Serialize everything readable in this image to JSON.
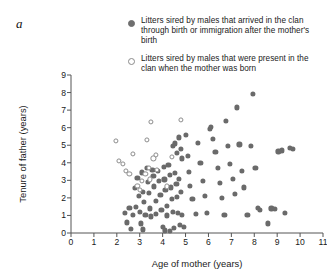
{
  "panel": {
    "label": "a"
  },
  "legend": {
    "position": "top-right",
    "items": [
      {
        "marker": "filled-circle",
        "color": "#6e6e6e",
        "label": "Litters sired by males that arrived in the clan through birth or immigration after the mother's birth"
      },
      {
        "marker": "open-circle",
        "color": "#8a8a8a",
        "label": "Litters sired by males that were present in the clan when the mother was born"
      }
    ]
  },
  "chart_data": {
    "type": "scatter",
    "title": "",
    "xlabel": "Age of mother (years)",
    "ylabel": "Tenure of father (years)",
    "xlim": [
      0,
      11
    ],
    "ylim": [
      0,
      9
    ],
    "xticks": [
      0,
      1,
      2,
      3,
      4,
      5,
      6,
      7,
      8,
      9,
      10,
      11
    ],
    "yticks": [
      0,
      1,
      2,
      3,
      4,
      5,
      6,
      7,
      8,
      9
    ],
    "xticklabels": [
      "0",
      "1",
      "2",
      "3",
      "4",
      "5",
      "6",
      "7",
      "8",
      "9",
      "10",
      "11"
    ],
    "yticklabels": [
      "0",
      "1",
      "2",
      "3",
      "4",
      "5",
      "6",
      "7",
      "8",
      "9"
    ],
    "grid": false,
    "series": [
      {
        "name": "Litters sired by males that arrived in the clan through birth or immigration after the mother's birth",
        "marker": "filled-circle",
        "color": "#6a6a6a",
        "points": [
          [
            2.35,
            1.15
          ],
          [
            2.45,
            0.6
          ],
          [
            2.55,
            1.45
          ],
          [
            2.7,
            1.05
          ],
          [
            2.8,
            2.55
          ],
          [
            2.85,
            1.5
          ],
          [
            2.9,
            3.15
          ],
          [
            2.95,
            2.1
          ],
          [
            3.0,
            1.2
          ],
          [
            3.05,
            0.55
          ],
          [
            3.1,
            3.45
          ],
          [
            3.15,
            2.35
          ],
          [
            3.2,
            1.75
          ],
          [
            3.25,
            1.05
          ],
          [
            3.3,
            3.7
          ],
          [
            3.35,
            2.9
          ],
          [
            3.4,
            2.3
          ],
          [
            3.45,
            1.4
          ],
          [
            3.5,
            0.95
          ],
          [
            3.55,
            3.6
          ],
          [
            3.6,
            3.25
          ],
          [
            3.62,
            2.65
          ],
          [
            3.7,
            1.85
          ],
          [
            3.72,
            1.1
          ],
          [
            3.8,
            3.55
          ],
          [
            3.85,
            2.95
          ],
          [
            3.9,
            2.15
          ],
          [
            3.95,
            1.3
          ],
          [
            4.0,
            0.35
          ],
          [
            4.05,
            3.75
          ],
          [
            4.08,
            3.05
          ],
          [
            4.12,
            2.45
          ],
          [
            4.18,
            1.55
          ],
          [
            4.2,
            1.0
          ],
          [
            4.25,
            3.9
          ],
          [
            4.3,
            3.3
          ],
          [
            4.35,
            2.6
          ],
          [
            4.4,
            1.95
          ],
          [
            4.45,
            1.2
          ],
          [
            4.5,
            0.3
          ],
          [
            4.55,
            3.4
          ],
          [
            4.6,
            2.8
          ],
          [
            4.62,
            2.05
          ],
          [
            4.68,
            1.15
          ],
          [
            4.72,
            3.1
          ],
          [
            4.8,
            2.35
          ],
          [
            4.85,
            1.05
          ],
          [
            4.92,
            0.35
          ],
          [
            4.45,
            4.95
          ],
          [
            4.55,
            5.1
          ],
          [
            4.62,
            4.55
          ],
          [
            4.7,
            5.45
          ],
          [
            4.78,
            4.8
          ],
          [
            4.85,
            4.25
          ],
          [
            5.0,
            5.6
          ],
          [
            5.1,
            4.4
          ],
          [
            5.15,
            3.5
          ],
          [
            5.2,
            2.7
          ],
          [
            5.3,
            1.95
          ],
          [
            5.45,
            1.1
          ],
          [
            5.55,
            5.15
          ],
          [
            5.65,
            4.0
          ],
          [
            5.75,
            2.95
          ],
          [
            5.85,
            2.1
          ],
          [
            5.95,
            1.15
          ],
          [
            6.05,
            5.95
          ],
          [
            6.1,
            6.05
          ],
          [
            6.2,
            5.35
          ],
          [
            6.3,
            4.6
          ],
          [
            6.4,
            3.7
          ],
          [
            6.5,
            2.85
          ],
          [
            6.6,
            2.0
          ],
          [
            6.7,
            1.05
          ],
          [
            6.75,
            6.4
          ],
          [
            6.85,
            4.95
          ],
          [
            6.95,
            3.95
          ],
          [
            7.05,
            3.1
          ],
          [
            7.15,
            2.25
          ],
          [
            7.25,
            7.15
          ],
          [
            7.35,
            5.05
          ],
          [
            7.45,
            3.55
          ],
          [
            7.55,
            2.6
          ],
          [
            7.7,
            1.05
          ],
          [
            7.85,
            4.95
          ],
          [
            7.95,
            7.9
          ],
          [
            8.05,
            3.7
          ],
          [
            8.15,
            1.45
          ],
          [
            8.25,
            1.3
          ],
          [
            8.6,
            0.55
          ],
          [
            8.75,
            1.4
          ],
          [
            8.9,
            1.35
          ],
          [
            9.05,
            4.65
          ],
          [
            9.2,
            4.7
          ],
          [
            9.35,
            1.15
          ],
          [
            9.55,
            4.85
          ],
          [
            9.7,
            4.8
          ],
          [
            2.6,
            0.25
          ],
          [
            3.15,
            0.2
          ],
          [
            4.1,
            0.15
          ],
          [
            4.3,
            0.1
          ],
          [
            4.75,
            0.45
          ]
        ]
      },
      {
        "name": "Litters sired by males that were present in the clan when the mother was born",
        "marker": "open-circle",
        "color": "#8c8c8c",
        "points": [
          [
            2.1,
            4.1
          ],
          [
            2.25,
            3.95
          ],
          [
            2.4,
            3.55
          ],
          [
            2.55,
            3.35
          ],
          [
            2.9,
            2.7
          ],
          [
            3.0,
            2.45
          ],
          [
            3.1,
            2.95
          ],
          [
            3.25,
            3.35
          ],
          [
            3.4,
            3.7
          ],
          [
            3.45,
            3.05
          ],
          [
            3.6,
            4.25
          ],
          [
            3.7,
            4.45
          ],
          [
            3.75,
            3.6
          ],
          [
            3.5,
            6.35
          ],
          [
            3.3,
            5.3
          ],
          [
            4.8,
            6.45
          ],
          [
            4.4,
            4.35
          ],
          [
            4.2,
            2.65
          ],
          [
            1.95,
            5.25
          ],
          [
            2.7,
            4.5
          ]
        ]
      }
    ]
  }
}
